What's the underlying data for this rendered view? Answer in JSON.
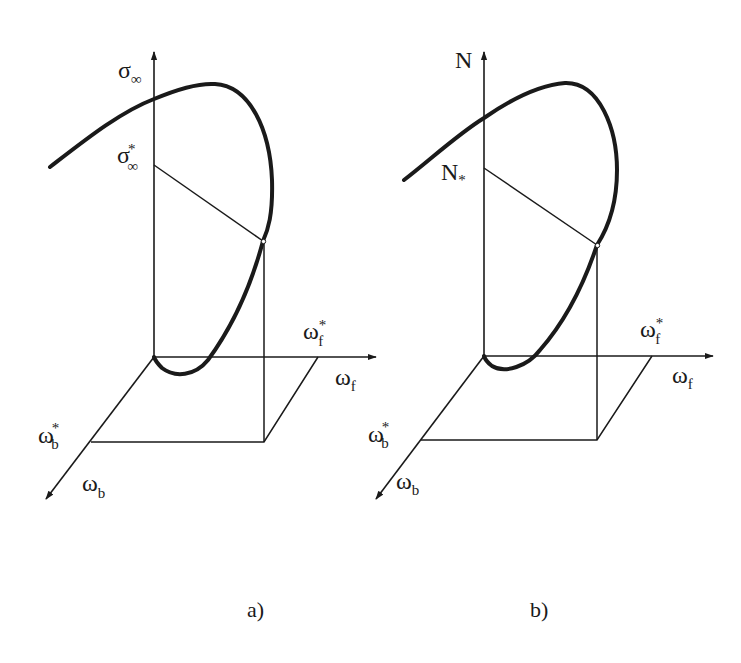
{
  "figure": {
    "panels": [
      {
        "id": "a",
        "caption": "a)",
        "vertical_axis": {
          "symbol": "σ",
          "subscript": "∞"
        },
        "vertical_marker": {
          "symbol": "σ",
          "subscript": "∞",
          "superscript": "*"
        },
        "forward_axis": {
          "symbol": "ω",
          "subscript": "f"
        },
        "forward_marker": {
          "symbol": "ω",
          "subscript": "f",
          "superscript": "*"
        },
        "back_axis": {
          "symbol": "ω",
          "subscript": "b"
        },
        "back_marker": {
          "symbol": "ω",
          "subscript": "b",
          "superscript": "*"
        }
      },
      {
        "id": "b",
        "caption": "b)",
        "vertical_axis": {
          "symbol": "N",
          "subscript": ""
        },
        "vertical_marker": {
          "symbol": "N",
          "subscript": "*",
          "superscript": ""
        },
        "forward_axis": {
          "symbol": "ω",
          "subscript": "f"
        },
        "forward_marker": {
          "symbol": "ω",
          "subscript": "f",
          "superscript": "*"
        },
        "back_axis": {
          "symbol": "ω",
          "subscript": "b"
        },
        "back_marker": {
          "symbol": "ω",
          "subscript": "b",
          "superscript": "*"
        }
      }
    ],
    "colors": {
      "ink": "#1a1a1a",
      "background": "#ffffff"
    }
  }
}
